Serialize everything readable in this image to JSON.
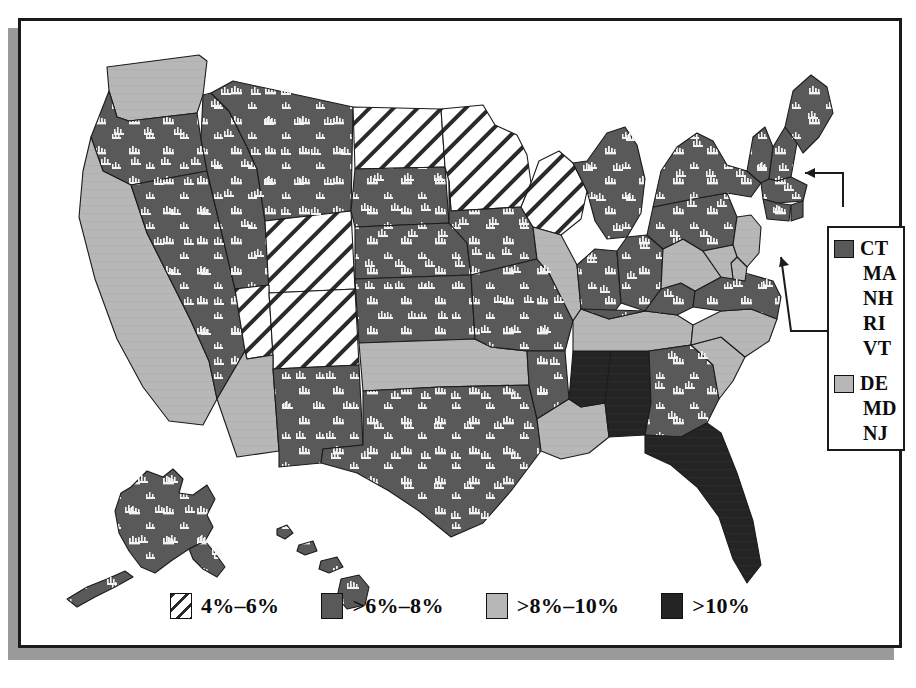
{
  "figure": {
    "kind": "choropleth-map",
    "region": "United States"
  },
  "legend": {
    "items": [
      {
        "label": "4%–6%",
        "fill": "hatch",
        "swatch_color": "#ffffff",
        "icon": "hatch-swatch-icon"
      },
      {
        "label": ">6%–8%",
        "fill": "pattern",
        "swatch_color": "#595959",
        "icon": "pattern-swatch-icon"
      },
      {
        "label": ">8%–10%",
        "fill": "light",
        "swatch_color": "#b7b7b7",
        "icon": "light-swatch-icon"
      },
      {
        "label": ">10%",
        "fill": "dark",
        "swatch_color": "#242424",
        "icon": "dark-swatch-icon"
      }
    ]
  },
  "inset": {
    "groups": [
      {
        "fill": "pattern",
        "swatch_color": "#595959",
        "icon": "pattern-swatch-icon",
        "states": [
          "CT",
          "MA",
          "NH",
          "RI",
          "VT"
        ]
      },
      {
        "fill": "light",
        "swatch_color": "#b7b7b7",
        "icon": "light-swatch-icon",
        "states": [
          "DE",
          "MD",
          "NJ"
        ]
      }
    ]
  },
  "colors": {
    "hatch_bg": "#ffffff",
    "hatch_line": "#2a2a2a",
    "pattern": "#595959",
    "light": "#b7b7b7",
    "dark": "#242424",
    "outline": "#1b1b1b",
    "frame": "#1b1b1b",
    "shadow": "#9a9a9a",
    "page_bg": "#ffffff"
  },
  "states": [
    {
      "code": "WA",
      "fill": "light"
    },
    {
      "code": "OR",
      "fill": "pattern"
    },
    {
      "code": "CA",
      "fill": "light"
    },
    {
      "code": "NV",
      "fill": "pattern"
    },
    {
      "code": "ID",
      "fill": "pattern"
    },
    {
      "code": "MT",
      "fill": "pattern"
    },
    {
      "code": "WY",
      "fill": "hatch"
    },
    {
      "code": "UT",
      "fill": "hatch"
    },
    {
      "code": "CO",
      "fill": "hatch"
    },
    {
      "code": "AZ",
      "fill": "light"
    },
    {
      "code": "NM",
      "fill": "pattern"
    },
    {
      "code": "TX",
      "fill": "pattern"
    },
    {
      "code": "OK",
      "fill": "light"
    },
    {
      "code": "KS",
      "fill": "pattern"
    },
    {
      "code": "NE",
      "fill": "pattern"
    },
    {
      "code": "SD",
      "fill": "pattern"
    },
    {
      "code": "ND",
      "fill": "hatch"
    },
    {
      "code": "MN",
      "fill": "hatch"
    },
    {
      "code": "IA",
      "fill": "pattern"
    },
    {
      "code": "MO",
      "fill": "pattern"
    },
    {
      "code": "AR",
      "fill": "pattern"
    },
    {
      "code": "LA",
      "fill": "light"
    },
    {
      "code": "MS",
      "fill": "dark"
    },
    {
      "code": "AL",
      "fill": "dark"
    },
    {
      "code": "TN",
      "fill": "light"
    },
    {
      "code": "KY",
      "fill": "pattern"
    },
    {
      "code": "IL",
      "fill": "light"
    },
    {
      "code": "WI",
      "fill": "hatch"
    },
    {
      "code": "MI",
      "fill": "pattern"
    },
    {
      "code": "IN",
      "fill": "pattern"
    },
    {
      "code": "OH",
      "fill": "pattern"
    },
    {
      "code": "WV",
      "fill": "light"
    },
    {
      "code": "VA",
      "fill": "pattern"
    },
    {
      "code": "NC",
      "fill": "light"
    },
    {
      "code": "SC",
      "fill": "light"
    },
    {
      "code": "GA",
      "fill": "pattern"
    },
    {
      "code": "FL",
      "fill": "dark"
    },
    {
      "code": "PA",
      "fill": "pattern"
    },
    {
      "code": "NY",
      "fill": "pattern"
    },
    {
      "code": "ME",
      "fill": "pattern"
    },
    {
      "code": "NH",
      "fill": "pattern"
    },
    {
      "code": "VT",
      "fill": "pattern"
    },
    {
      "code": "MA",
      "fill": "pattern"
    },
    {
      "code": "CT",
      "fill": "pattern"
    },
    {
      "code": "RI",
      "fill": "pattern"
    },
    {
      "code": "NJ",
      "fill": "light"
    },
    {
      "code": "DE",
      "fill": "light"
    },
    {
      "code": "MD",
      "fill": "light"
    },
    {
      "code": "AK",
      "fill": "pattern"
    },
    {
      "code": "HI",
      "fill": "pattern"
    }
  ]
}
